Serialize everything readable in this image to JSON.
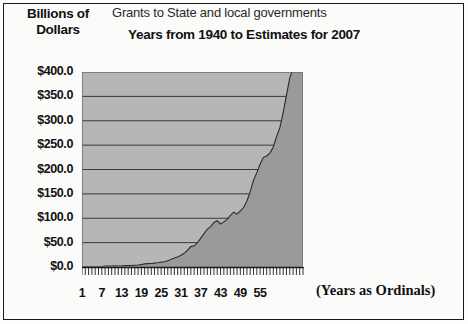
{
  "figure": {
    "axis_title": "Billions of Dollars",
    "title": "Grants to State and local governments",
    "subtitle": "Years from 1940 to Estimates for 2007",
    "x_caption": "(Years as Ordinals)"
  },
  "colors": {
    "plot_background": "#b6b6b6",
    "area_fill": "#9a9a9a",
    "gridline": "#3a3a3a",
    "axis": "#1b1b1b",
    "text": "#111111",
    "page_background": "#fbfbfa"
  },
  "chart_data": {
    "type": "area",
    "title": "Grants to State and local governments",
    "subtitle": "Years from 1940 to Estimates for 2007",
    "xlabel": "(Years as Ordinals)",
    "ylabel": "Billions of Dollars",
    "xlim": [
      1,
      68
    ],
    "ylim": [
      0,
      400
    ],
    "ytick_labels": [
      "$400.0",
      "$350.0",
      "$300.0",
      "$250.0",
      "$200.0",
      "$150.0",
      "$100.0",
      "$50.0",
      "$0.0"
    ],
    "ytick_values": [
      400,
      350,
      300,
      250,
      200,
      150,
      100,
      50,
      0
    ],
    "xtick_labels": [
      "1",
      "7",
      "13",
      "19",
      "25",
      "31",
      "37",
      "43",
      "49",
      "55"
    ],
    "xtick_values": [
      1,
      7,
      13,
      19,
      25,
      31,
      37,
      43,
      49,
      55
    ],
    "grid": "horizontal",
    "legend": "none",
    "x": [
      1,
      2,
      3,
      4,
      5,
      6,
      7,
      8,
      9,
      10,
      11,
      12,
      13,
      14,
      15,
      16,
      17,
      18,
      19,
      20,
      21,
      22,
      23,
      24,
      25,
      26,
      27,
      28,
      29,
      30,
      31,
      32,
      33,
      34,
      35,
      36,
      37,
      38,
      39,
      40,
      41,
      42,
      43,
      44,
      45,
      46,
      47,
      48,
      49,
      50,
      51,
      52,
      53,
      54,
      55,
      56,
      57,
      58,
      59,
      60,
      61,
      62,
      63,
      64,
      65,
      66,
      67,
      68
    ],
    "years": [
      1940,
      1941,
      1942,
      1943,
      1944,
      1945,
      1946,
      1947,
      1948,
      1949,
      1950,
      1951,
      1952,
      1953,
      1954,
      1955,
      1956,
      1957,
      1958,
      1959,
      1960,
      1961,
      1962,
      1963,
      1964,
      1965,
      1966,
      1967,
      1968,
      1969,
      1970,
      1971,
      1972,
      1973,
      1974,
      1975,
      1976,
      1977,
      1978,
      1979,
      1980,
      1981,
      1982,
      1983,
      1984,
      1985,
      1986,
      1987,
      1988,
      1989,
      1990,
      1991,
      1992,
      1993,
      1994,
      1995,
      1996,
      1997,
      1998,
      1999,
      2000,
      2001,
      2002,
      2003,
      2004,
      2005,
      2006,
      2007
    ],
    "values": [
      0.9,
      1.0,
      1.0,
      1.1,
      1.0,
      0.9,
      0.8,
      1.7,
      1.7,
      1.9,
      2.3,
      2.2,
      2.4,
      2.8,
      3.0,
      3.2,
      3.7,
      4.0,
      4.9,
      6.5,
      7.0,
      7.1,
      7.9,
      8.6,
      10.1,
      10.9,
      13.0,
      15.2,
      18.6,
      20.3,
      24.1,
      28.1,
      34.4,
      41.8,
      43.4,
      49.8,
      59.1,
      68.4,
      77.9,
      82.9,
      91.4,
      94.8,
      88.2,
      92.5,
      97.6,
      105.9,
      112.4,
      108.4,
      115.3,
      122.0,
      135.3,
      154.5,
      178.1,
      193.6,
      210.6,
      225.0,
      227.8,
      234.2,
      246.1,
      267.9,
      285.9,
      317.2,
      352.9,
      388.5,
      406.4,
      428.0,
      434.1,
      447.0
    ]
  }
}
